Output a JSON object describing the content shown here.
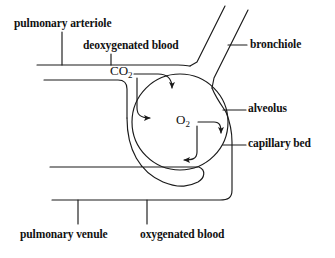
{
  "diagram": {
    "stroke_color": "#1a1a1a",
    "background_color": "#ffffff",
    "labels": {
      "pulmonary_arteriole": "pulmonary arteriole",
      "deoxygenated_blood": "deoxygenated blood",
      "bronchiole": "bronchiole",
      "alveolus": "alveolus",
      "capillary_bed": "capillary bed",
      "pulmonary_venule": "pulmonary venule",
      "oxygenated_blood": "oxygenated blood"
    },
    "gas_labels": {
      "carbon_dioxide": "CO",
      "carbon_dioxide_subscript": "2",
      "oxygen": "O",
      "oxygen_subscript": "2"
    },
    "structures": [
      "pulmonary arteriole",
      "bronchiole",
      "alveolus",
      "capillary bed",
      "pulmonary venule"
    ],
    "gas_flow": [
      "CO2 diffuses from blood into alveolus",
      "O2 diffuses from alveolus into blood"
    ]
  }
}
